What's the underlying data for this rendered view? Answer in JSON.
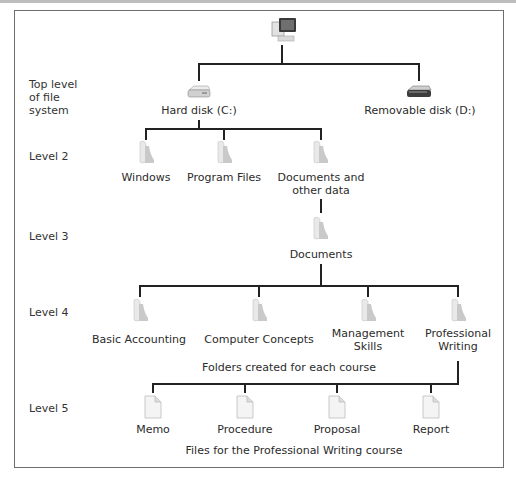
{
  "level_labels": {
    "top": [
      "Top level",
      "of file",
      "system"
    ],
    "level2": "Level 2",
    "level3": "Level 3",
    "level4": "Level 4",
    "level5": "Level 5"
  },
  "root": {
    "icon": "computer-icon"
  },
  "drives": [
    {
      "label": "Hard disk (C:)",
      "icon": "hard-disk-icon"
    },
    {
      "label": "Removable disk (D:)",
      "icon": "removable-disk-icon"
    }
  ],
  "level2_folders": [
    {
      "label": "Windows"
    },
    {
      "label": "Program Files"
    },
    {
      "label_lines": [
        "Documents and",
        "other data"
      ]
    }
  ],
  "level3_folder": {
    "label": "Documents"
  },
  "course_folders": [
    {
      "label_lines": [
        "Basic Accounting"
      ]
    },
    {
      "label_lines": [
        "Computer Concepts"
      ]
    },
    {
      "label_lines": [
        "Management",
        "Skills"
      ]
    },
    {
      "label_lines": [
        "Professional",
        "Writing"
      ]
    }
  ],
  "course_caption": "Folders created for each course",
  "files": [
    {
      "label": "Memo"
    },
    {
      "label": "Procedure"
    },
    {
      "label": "Proposal"
    },
    {
      "label": "Report"
    }
  ],
  "files_caption": "Files for the Professional Writing course",
  "colors": {
    "line": "#222222",
    "frame": "#6e6e6e",
    "text": "#2b2b2b"
  }
}
